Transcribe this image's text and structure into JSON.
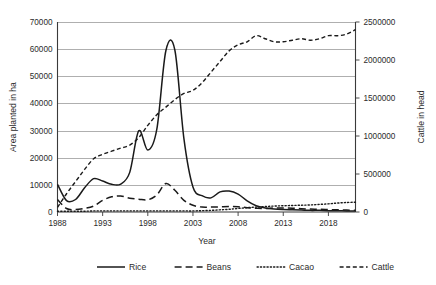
{
  "chart_data": {
    "type": "line",
    "title": "",
    "xlabel": "Year",
    "ylabel": "Area planted in ha",
    "y2label": "Cattle in head",
    "grid": true,
    "legend_position": "bottom",
    "xlim": [
      1988,
      2021
    ],
    "xticks": [
      1988,
      1993,
      1998,
      2003,
      2008,
      2013,
      2018
    ],
    "xticklabels": [
      "1988",
      "1993",
      "1998",
      "2003",
      "2008",
      "2013",
      "2018"
    ],
    "ylim": [
      0,
      70000
    ],
    "yticks": [
      0,
      10000,
      20000,
      30000,
      40000,
      50000,
      60000,
      70000
    ],
    "yticklabels": [
      "0",
      "10000",
      "20000",
      "30000",
      "40000",
      "50000",
      "60000",
      "70000"
    ],
    "y2lim": [
      0,
      2500000
    ],
    "y2ticks": [
      0,
      500000,
      1000000,
      1500000,
      2000000,
      2500000
    ],
    "y2ticklabels": [
      "0",
      "500000",
      "1000000",
      "1500000",
      "2000000",
      "2500000"
    ],
    "x": [
      1988,
      1989,
      1990,
      1991,
      1992,
      1993,
      1994,
      1995,
      1996,
      1997,
      1998,
      1999,
      2000,
      2001,
      2002,
      2003,
      2004,
      2005,
      2006,
      2007,
      2008,
      2009,
      2010,
      2011,
      2012,
      2013,
      2014,
      2015,
      2016,
      2017,
      2018,
      2019,
      2020,
      2021
    ],
    "series": [
      {
        "name": "Rice",
        "axis": "left",
        "style": "solid",
        "units": "ha",
        "values": [
          10200,
          4200,
          4600,
          8900,
          12300,
          11400,
          10200,
          10300,
          14600,
          29900,
          22800,
          30500,
          59400,
          59600,
          27000,
          9200,
          6000,
          5200,
          7400,
          7700,
          6600,
          4100,
          2300,
          1500,
          1100,
          900,
          800,
          700,
          600,
          600,
          500,
          500,
          400,
          400
        ]
      },
      {
        "name": "Beans",
        "axis": "left",
        "style": "long-dash",
        "units": "ha",
        "values": [
          4600,
          1300,
          900,
          1300,
          2200,
          4300,
          5600,
          5900,
          5100,
          4700,
          4500,
          6300,
          10500,
          8000,
          4300,
          2500,
          1800,
          1800,
          1900,
          2000,
          1900,
          1600,
          1400,
          1300,
          1500,
          1500,
          1400,
          1200,
          1100,
          1000,
          900,
          800,
          700,
          600
        ]
      },
      {
        "name": "Cacao",
        "axis": "left",
        "style": "dotted",
        "units": "ha",
        "values": [
          300,
          300,
          300,
          300,
          400,
          400,
          400,
          400,
          400,
          400,
          400,
          400,
          400,
          400,
          400,
          400,
          500,
          600,
          800,
          1000,
          1300,
          1600,
          1800,
          2000,
          2200,
          2300,
          2400,
          2500,
          2600,
          2800,
          3000,
          3300,
          3500,
          3600
        ]
      },
      {
        "name": "Cattle",
        "axis": "right",
        "style": "dash",
        "units": "head",
        "values": [
          60000,
          240000,
          400000,
          560000,
          700000,
          760000,
          800000,
          840000,
          880000,
          980000,
          1140000,
          1280000,
          1380000,
          1480000,
          1560000,
          1600000,
          1700000,
          1840000,
          1980000,
          2120000,
          2200000,
          2240000,
          2320000,
          2280000,
          2240000,
          2240000,
          2260000,
          2280000,
          2260000,
          2280000,
          2320000,
          2320000,
          2340000,
          2400000
        ]
      }
    ]
  },
  "legend": {
    "items": [
      {
        "label": "Rice",
        "style": "solid"
      },
      {
        "label": "Beans",
        "style": "long-dash"
      },
      {
        "label": "Cacao",
        "style": "dotted"
      },
      {
        "label": "Cattle",
        "style": "dash"
      }
    ]
  }
}
